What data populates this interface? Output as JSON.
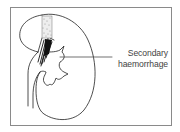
{
  "figure": {
    "annotation": {
      "line1": "Secondary",
      "line2": "haemorrhage"
    },
    "colors": {
      "stroke": "#222222",
      "frame": "#8a8a8a",
      "text": "#444444",
      "background": "#ffffff"
    }
  }
}
